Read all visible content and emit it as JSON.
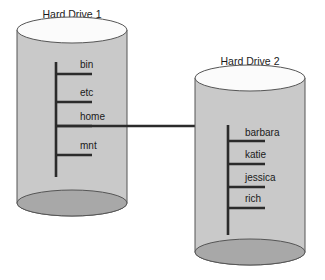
{
  "diagram": {
    "type": "filesystem-mount-diagram",
    "colors": {
      "cylinder_body": "#c9c9c9",
      "cylinder_top": "#fbfbfb",
      "cylinder_bottom": "#a8a8a8",
      "outline": "#555555",
      "tree": "#2b2b2b",
      "text": "#1a1a1a",
      "background": "#ffffff"
    },
    "drives": [
      {
        "id": "hard-drive-1",
        "title": "Hard Drive 1",
        "title_x": 72,
        "title_y": 18,
        "cylinder": {
          "cx": 72,
          "top_y": 30,
          "bottom_y": 203,
          "rx": 55,
          "ry": 13
        },
        "trunk": {
          "x": 56,
          "y_top": 62,
          "y_bottom": 177
        },
        "nodes": [
          {
            "label": "bin",
            "branch_y": 74,
            "branch_x_end": 92,
            "label_x": 80,
            "label_y": 68
          },
          {
            "label": "etc",
            "branch_y": 102,
            "branch_x_end": 92,
            "label_x": 80,
            "label_y": 96
          },
          {
            "label": "home",
            "branch_y": 126,
            "branch_x_end": 92,
            "label_x": 80,
            "label_y": 120,
            "is_mount_point": true
          },
          {
            "label": "mnt",
            "branch_y": 155,
            "branch_x_end": 92,
            "label_x": 80,
            "label_y": 149
          }
        ]
      },
      {
        "id": "hard-drive-2",
        "title": "Hard Drive 2",
        "title_x": 250,
        "title_y": 65,
        "cylinder": {
          "cx": 250,
          "top_y": 78,
          "bottom_y": 252,
          "rx": 55,
          "ry": 13
        },
        "trunk": {
          "x": 228,
          "y_top": 125,
          "y_bottom": 235
        },
        "nodes": [
          {
            "label": "barbara",
            "branch_y": 141,
            "branch_x_end": 265,
            "label_x": 245,
            "label_y": 136
          },
          {
            "label": "katie",
            "branch_y": 164,
            "branch_x_end": 265,
            "label_x": 245,
            "label_y": 158
          },
          {
            "label": "jessica",
            "branch_y": 187,
            "branch_x_end": 265,
            "label_x": 245,
            "label_y": 181
          },
          {
            "label": "rich",
            "branch_y": 208,
            "branch_x_end": 265,
            "label_x": 245,
            "label_y": 202
          }
        ]
      }
    ],
    "mount_connection": {
      "from_label": "home",
      "to_drive": "Hard Drive 2",
      "x_start": 56,
      "x_end": 228,
      "y": 126
    }
  }
}
